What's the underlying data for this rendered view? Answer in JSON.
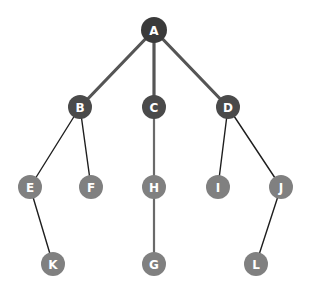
{
  "diagram": {
    "type": "tree",
    "colors": {
      "root": "#3a3a3a",
      "level1": "#4a4a4a",
      "leaf": "#808080",
      "edge_thick": "#555555",
      "edge_thin": "#1e1e1e",
      "edge_mid": "#6a6a6a",
      "label": "#ffffff"
    },
    "nodes": [
      {
        "id": "A",
        "label": "A",
        "x": 154,
        "y": 30,
        "r": 13,
        "level": 0
      },
      {
        "id": "B",
        "label": "B",
        "x": 80,
        "y": 107,
        "r": 12,
        "level": 1
      },
      {
        "id": "C",
        "label": "C",
        "x": 154,
        "y": 107,
        "r": 12,
        "level": 1
      },
      {
        "id": "D",
        "label": "D",
        "x": 228,
        "y": 107,
        "r": 12,
        "level": 1
      },
      {
        "id": "E",
        "label": "E",
        "x": 30,
        "y": 187,
        "r": 12,
        "level": 2
      },
      {
        "id": "F",
        "label": "F",
        "x": 91,
        "y": 187,
        "r": 12,
        "level": 2
      },
      {
        "id": "H",
        "label": "H",
        "x": 154,
        "y": 187,
        "r": 12,
        "level": 2
      },
      {
        "id": "I",
        "label": "I",
        "x": 218,
        "y": 187,
        "r": 12,
        "level": 2
      },
      {
        "id": "J",
        "label": "J",
        "x": 281,
        "y": 187,
        "r": 12,
        "level": 2
      },
      {
        "id": "K",
        "label": "K",
        "x": 53,
        "y": 264,
        "r": 12,
        "level": 3
      },
      {
        "id": "G",
        "label": "G",
        "x": 154,
        "y": 264,
        "r": 12,
        "level": 3
      },
      {
        "id": "L",
        "label": "L",
        "x": 256,
        "y": 264,
        "r": 12,
        "level": 3
      }
    ],
    "edges": [
      {
        "from": "A",
        "to": "B",
        "style": "thick"
      },
      {
        "from": "A",
        "to": "C",
        "style": "thick"
      },
      {
        "from": "A",
        "to": "D",
        "style": "thick"
      },
      {
        "from": "B",
        "to": "E",
        "style": "thin"
      },
      {
        "from": "B",
        "to": "F",
        "style": "thin"
      },
      {
        "from": "C",
        "to": "H",
        "style": "mid"
      },
      {
        "from": "D",
        "to": "I",
        "style": "thin"
      },
      {
        "from": "D",
        "to": "J",
        "style": "thin"
      },
      {
        "from": "E",
        "to": "K",
        "style": "thin"
      },
      {
        "from": "H",
        "to": "G",
        "style": "mid"
      },
      {
        "from": "J",
        "to": "L",
        "style": "thin"
      }
    ]
  }
}
